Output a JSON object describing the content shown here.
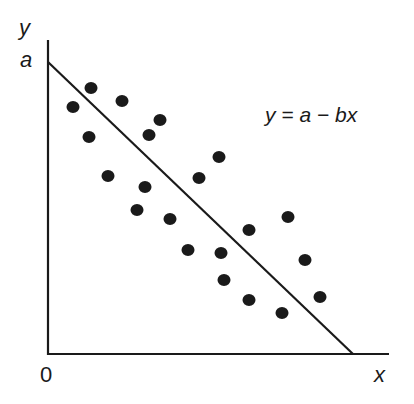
{
  "chart_data": {
    "type": "scatter",
    "title": "",
    "xlabel": "x",
    "ylabel": "y",
    "origin_label": "0",
    "y_intercept_label": "a",
    "annotation": "y = a − bx",
    "grid": false,
    "legend": null,
    "fit_line": {
      "equation": "y = a - bx",
      "intercept_label": "a",
      "x_start": 0,
      "y_start": 1.0,
      "x_end": 1.0,
      "y_end": 0
    },
    "xlim": [
      0,
      1.12
    ],
    "ylim": [
      0,
      1.08
    ],
    "points_px": [
      [
        73,
        107
      ],
      [
        91,
        88
      ],
      [
        122,
        101
      ],
      [
        160,
        120
      ],
      [
        89,
        137
      ],
      [
        149,
        135
      ],
      [
        108,
        176
      ],
      [
        145,
        187
      ],
      [
        137,
        210
      ],
      [
        170,
        219
      ],
      [
        199,
        178
      ],
      [
        219,
        157
      ],
      [
        188,
        250
      ],
      [
        221,
        253
      ],
      [
        249,
        230
      ],
      [
        288,
        217
      ],
      [
        305,
        260
      ],
      [
        224,
        280
      ],
      [
        249,
        300
      ],
      [
        320,
        297
      ],
      [
        282,
        313
      ]
    ],
    "points": [
      {
        "x": 0.083,
        "y": 0.845
      },
      {
        "x": 0.142,
        "y": 0.91
      },
      {
        "x": 0.243,
        "y": 0.866
      },
      {
        "x": 0.366,
        "y": 0.801
      },
      {
        "x": 0.136,
        "y": 0.743
      },
      {
        "x": 0.33,
        "y": 0.749
      },
      {
        "x": 0.197,
        "y": 0.61
      },
      {
        "x": 0.317,
        "y": 0.572
      },
      {
        "x": 0.291,
        "y": 0.493
      },
      {
        "x": 0.398,
        "y": 0.462
      },
      {
        "x": 0.492,
        "y": 0.603
      },
      {
        "x": 0.557,
        "y": 0.675
      },
      {
        "x": 0.456,
        "y": 0.356
      },
      {
        "x": 0.563,
        "y": 0.346
      },
      {
        "x": 0.654,
        "y": 0.425
      },
      {
        "x": 0.78,
        "y": 0.469
      },
      {
        "x": 0.835,
        "y": 0.322
      },
      {
        "x": 0.573,
        "y": 0.253
      },
      {
        "x": 0.654,
        "y": 0.185
      },
      {
        "x": 0.885,
        "y": 0.195
      },
      {
        "x": 0.761,
        "y": 0.14
      }
    ]
  },
  "colors": {
    "ink": "#1a1a1a",
    "background": "#ffffff"
  }
}
